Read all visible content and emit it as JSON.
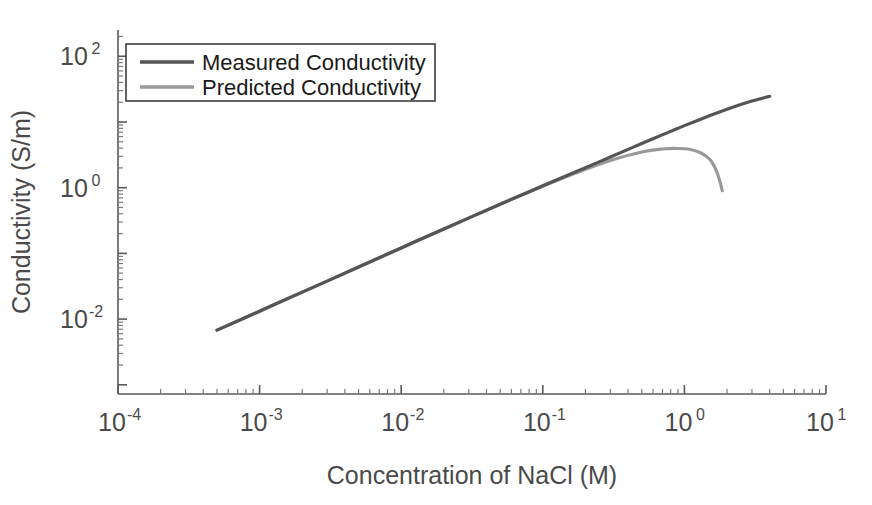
{
  "chart_data": {
    "type": "line",
    "title": "",
    "xlabel": "Concentration of NaCl (M)",
    "ylabel": "Conductivity (S/m)",
    "xscale": "log",
    "yscale": "log",
    "xlim": [
      0.0001,
      10
    ],
    "ylim": [
      0.0007244,
      251.19
    ],
    "grid": false,
    "legend_position": "top-left",
    "x_tick_labels": [
      "10-4",
      "10-3",
      "10-2",
      "10-1",
      "100",
      "101"
    ],
    "x_tick_mantissa": [
      "10",
      "10",
      "10",
      "10",
      "10",
      "10"
    ],
    "x_tick_exponents": [
      "-4",
      "-3",
      "-2",
      "-1",
      "0",
      "1"
    ],
    "x_tick_values": [
      0.0001,
      0.001,
      0.01,
      0.1,
      1,
      10
    ],
    "y_tick_mantissa": [
      "10",
      "10",
      "10"
    ],
    "y_tick_exponents": [
      "2",
      "0",
      "-2"
    ],
    "y_tick_values": [
      100,
      1,
      0.01
    ],
    "series": [
      {
        "name": "Measured Conductivity",
        "color": "#555555",
        "linewidth": 3.2,
        "x": [
          0.0005,
          0.001,
          0.002,
          0.005,
          0.01,
          0.02,
          0.05,
          0.1,
          0.2,
          0.3,
          0.5,
          0.8,
          1.0,
          1.5,
          2.0,
          2.5,
          3.0,
          3.5,
          4.0
        ],
        "y": [
          0.0068,
          0.0132,
          0.0257,
          0.062,
          0.121,
          0.235,
          0.56,
          1.067,
          2.01,
          2.93,
          4.7,
          7.2,
          8.8,
          12.4,
          15.6,
          18.4,
          20.8,
          22.8,
          24.6
        ]
      },
      {
        "name": "Predicted Conductivity",
        "color": "#999999",
        "linewidth": 3.2,
        "x": [
          0.0005,
          0.001,
          0.002,
          0.005,
          0.01,
          0.02,
          0.05,
          0.1,
          0.2,
          0.3,
          0.5,
          0.7,
          0.9,
          1.1,
          1.3,
          1.5,
          1.6,
          1.7,
          1.8,
          1.85
        ],
        "y": [
          0.0068,
          0.0132,
          0.0257,
          0.062,
          0.121,
          0.235,
          0.56,
          1.05,
          1.9,
          2.6,
          3.5,
          3.88,
          3.95,
          3.82,
          3.4,
          2.75,
          2.25,
          1.7,
          1.15,
          0.9
        ]
      }
    ]
  },
  "legend": {
    "entries": [
      {
        "label": "Measured Conductivity",
        "color": "#555555"
      },
      {
        "label": "Predicted Conductivity",
        "color": "#999999"
      }
    ]
  },
  "axes": {
    "x_title": "Concentration of NaCl (M)",
    "y_title": "Conductivity (S/m)"
  }
}
